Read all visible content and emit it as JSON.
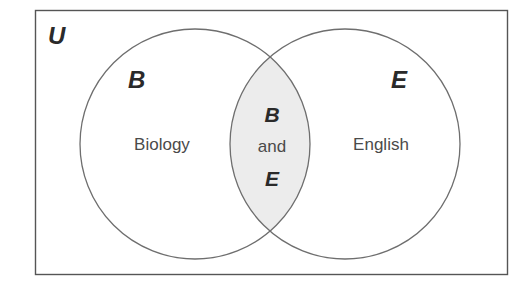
{
  "diagram": {
    "type": "venn",
    "universe_label": "U",
    "sets": [
      {
        "letter": "B",
        "name": "Biology"
      },
      {
        "letter": "E",
        "name": "English"
      }
    ],
    "intersection": {
      "line1": "B",
      "line2": "and",
      "line3": "E"
    },
    "colors": {
      "stroke": "#6e6e6e",
      "border": "#555555",
      "intersection_fill": "#ececec",
      "background": "#ffffff",
      "letter": "#2a2a2a",
      "text": "#4a4a4a"
    }
  }
}
